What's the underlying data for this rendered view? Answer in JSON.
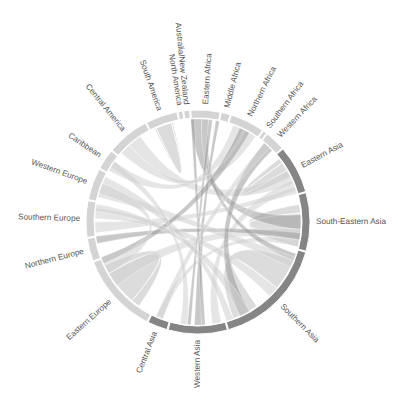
{
  "chart_data": {
    "type": "chord",
    "title": "",
    "center": [
      198,
      222
    ],
    "outer_radius": 112,
    "ring_thickness": 8,
    "colors": {
      "light_segment": "#d4d4d4",
      "dark_segment": "#858585",
      "chord_light": "#d0d0d0",
      "chord_dark": "#9a9a9a",
      "label": "#555555",
      "gap": "#ffffff"
    },
    "regions": [
      {
        "name": "South America",
        "start": 332.3,
        "end": 349.4,
        "shade": "light"
      },
      {
        "name": "North America",
        "start": 349.4,
        "end": 352.4,
        "shade": "light"
      },
      {
        "name": "Australia/New Zealand",
        "start": 352.4,
        "end": 356.0,
        "shade": "light"
      },
      {
        "name": "Eastern Africa",
        "start": 356.0,
        "end": 371.7,
        "shade": "light"
      },
      {
        "name": "Middle Africa",
        "start": 11.7,
        "end": 17.0,
        "shade": "light"
      },
      {
        "name": "Northern Africa",
        "start": 17.0,
        "end": 35.4,
        "shade": "light"
      },
      {
        "name": "Southern Africa",
        "start": 35.4,
        "end": 38.0,
        "shade": "light"
      },
      {
        "name": "Western Africa",
        "start": 38.0,
        "end": 49.0,
        "shade": "light"
      },
      {
        "name": "Eastern Asia",
        "start": 49.0,
        "end": 74.5,
        "shade": "dark"
      },
      {
        "name": "South-Eastern Asia",
        "start": 74.5,
        "end": 105.4,
        "shade": "dark"
      },
      {
        "name": "Southern Asia",
        "start": 105.4,
        "end": 164.5,
        "shade": "dark"
      },
      {
        "name": "Western Asia",
        "start": 164.5,
        "end": 195.8,
        "shade": "dark"
      },
      {
        "name": "Central Asia",
        "start": 195.8,
        "end": 206.8,
        "shade": "dark"
      },
      {
        "name": "Eastern Europe",
        "start": 206.8,
        "end": 249.3,
        "shade": "light"
      },
      {
        "name": "Northern Europe",
        "start": 249.3,
        "end": 261.8,
        "shade": "light"
      },
      {
        "name": "Southern Europe",
        "start": 261.8,
        "end": 281.3,
        "shade": "light"
      },
      {
        "name": "Western Europe",
        "start": 281.3,
        "end": 298.4,
        "shade": "light"
      },
      {
        "name": "Caribbean",
        "start": 298.4,
        "end": 309.6,
        "shade": "light"
      },
      {
        "name": "Central America",
        "start": 309.6,
        "end": 332.3,
        "shade": "light"
      }
    ],
    "chords": [
      {
        "from": [
          112,
          130
        ],
        "to": [
          145,
          160
        ],
        "shade": "light",
        "width": 26,
        "self": true
      },
      {
        "from": [
          215,
          240
        ],
        "to": [
          220,
          245
        ],
        "shade": "light",
        "width": 22,
        "self": true
      },
      {
        "from": [
          80,
          100
        ],
        "to": [
          85,
          104
        ],
        "shade": "light",
        "width": 12,
        "self": true
      },
      {
        "from": [
          52,
          60
        ],
        "to": [
          55,
          64
        ],
        "shade": "light",
        "width": 8,
        "self": true
      },
      {
        "from": [
          335,
          345
        ],
        "to": [
          336,
          346
        ],
        "shade": "light",
        "width": 8,
        "self": true
      },
      {
        "from": [
          60,
          68
        ],
        "to": [
          318,
          326
        ],
        "shade": "light",
        "width": 6
      },
      {
        "from": [
          86,
          94
        ],
        "to": [
          356,
          362
        ],
        "shade": "dark",
        "width": 3
      },
      {
        "from": [
          94,
          100
        ],
        "to": [
          232,
          240
        ],
        "shade": "light",
        "width": 6
      },
      {
        "from": [
          100,
          104
        ],
        "to": [
          200,
          204
        ],
        "shade": "light",
        "width": 4
      },
      {
        "from": [
          66,
          72
        ],
        "to": [
          167,
          172
        ],
        "shade": "light",
        "width": 5
      },
      {
        "from": [
          108,
          112
        ],
        "to": [
          2,
          6
        ],
        "shade": "dark",
        "width": 2
      },
      {
        "from": [
          10,
          12
        ],
        "to": [
          178,
          182
        ],
        "shade": "dark",
        "width": 2
      },
      {
        "from": [
          6,
          8
        ],
        "to": [
          184,
          186
        ],
        "shade": "dark",
        "width": 1.5
      },
      {
        "from": [
          356,
          358
        ],
        "to": [
          176,
          178
        ],
        "shade": "dark",
        "width": 1.5
      },
      {
        "from": [
          258,
          262
        ],
        "to": [
          96,
          100
        ],
        "shade": "dark",
        "width": 2
      },
      {
        "from": [
          264,
          270
        ],
        "to": [
          70,
          74
        ],
        "shade": "light",
        "width": 4
      },
      {
        "from": [
          272,
          278
        ],
        "to": [
          130,
          136
        ],
        "shade": "light",
        "width": 4
      },
      {
        "from": [
          284,
          290
        ],
        "to": [
          110,
          116
        ],
        "shade": "light",
        "width": 3
      },
      {
        "from": [
          290,
          296
        ],
        "to": [
          160,
          164
        ],
        "shade": "light",
        "width": 3
      },
      {
        "from": [
          300,
          306
        ],
        "to": [
          20,
          26
        ],
        "shade": "light",
        "width": 3
      },
      {
        "from": [
          312,
          318
        ],
        "to": [
          28,
          34
        ],
        "shade": "light",
        "width": 3
      },
      {
        "from": [
          24,
          30
        ],
        "to": [
          246,
          250
        ],
        "shade": "dark",
        "width": 2
      },
      {
        "from": [
          40,
          46
        ],
        "to": [
          150,
          156
        ],
        "shade": "dark",
        "width": 2
      },
      {
        "from": [
          200,
          204
        ],
        "to": [
          40,
          44
        ],
        "shade": "light",
        "width": 2
      },
      {
        "from": [
          186,
          190
        ],
        "to": [
          302,
          306
        ],
        "shade": "light",
        "width": 2
      },
      {
        "from": [
          150,
          156
        ],
        "to": [
          276,
          280
        ],
        "shade": "light",
        "width": 2
      },
      {
        "from": [
          240,
          246
        ],
        "to": [
          286,
          292
        ],
        "shade": "light",
        "width": 3
      }
    ]
  }
}
